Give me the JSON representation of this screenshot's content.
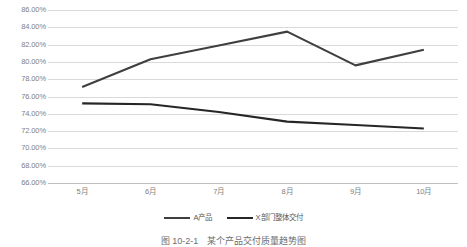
{
  "chart_data": {
    "type": "line",
    "title": "",
    "xlabel": "",
    "ylabel": "",
    "categories": [
      "5月",
      "6月",
      "7月",
      "8月",
      "9月",
      "10月"
    ],
    "ylim": [
      66,
      86
    ],
    "ytick_step": 2,
    "ytick_labels": [
      "86.00%",
      "84.00%",
      "82.00%",
      "80.00%",
      "78.00%",
      "76.00%",
      "74.00%",
      "72.00%",
      "70.00%",
      "68.00%",
      "66.00%"
    ],
    "ytick_values": [
      86,
      84,
      82,
      80,
      78,
      76,
      74,
      72,
      70,
      68,
      66
    ],
    "value_format": "percent",
    "grid": true,
    "legend_position": "bottom",
    "series": [
      {
        "name": "A产品",
        "color": "#3f3f3f",
        "values": [
          77.1,
          80.3,
          81.9,
          83.5,
          79.6,
          81.4
        ]
      },
      {
        "name": "X部门整体交付",
        "color": "#262626",
        "values": [
          75.2,
          75.1,
          74.2,
          73.1,
          72.7,
          72.3
        ]
      }
    ]
  },
  "legend": {
    "entries": [
      {
        "label": "A产品"
      },
      {
        "label": "X部门整体交付"
      }
    ]
  },
  "caption": {
    "text": "图 10-2-1　某个产品交付质量趋势图"
  },
  "colors": {
    "line_primary": "#3f3f3f",
    "line_secondary": "#262626",
    "gridline": "#d9d9d9",
    "axis": "#bfbfbf",
    "tick_text": "#808080",
    "background": "#ffffff"
  }
}
